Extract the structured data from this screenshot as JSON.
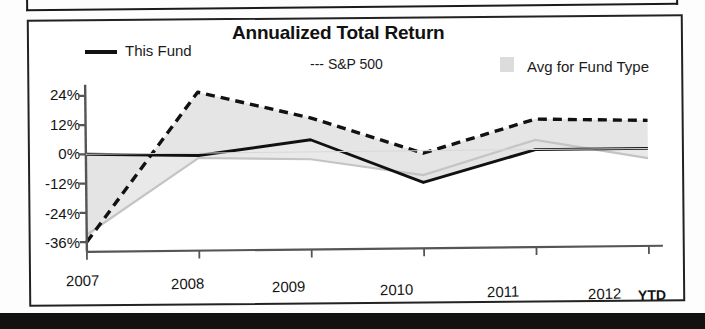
{
  "chart_data": {
    "type": "line",
    "title": "Annualized Total Return",
    "xlabel": "",
    "ylabel": "",
    "categories": [
      "2007",
      "2008",
      "2009",
      "2010",
      "2011",
      "2012"
    ],
    "x_tick_labels": [
      "2007",
      "2008",
      "2009",
      "2010",
      "2011",
      "2012"
    ],
    "x_axis_note": "YTD",
    "y_tick_labels": [
      "24%",
      "12%",
      "0%",
      "-12%",
      "-24%",
      "-36%"
    ],
    "y_tick_values": [
      24,
      12,
      0,
      -12,
      -24,
      -36
    ],
    "ylim": [
      -40,
      28
    ],
    "grid": false,
    "legend_position": "top",
    "series": [
      {
        "name": "This Fund",
        "style": "solid-line",
        "color": "#111111",
        "values": [
          0,
          -1,
          5,
          -13,
          0,
          0
        ]
      },
      {
        "name": "S&P 500",
        "style": "dashed-line",
        "color": "#111111",
        "values": [
          -36,
          25,
          14,
          -1,
          12.5,
          11.5
        ]
      },
      {
        "name": "Avg for Fund Type",
        "style": "shaded-band-gray-line",
        "color": "#c9c9c9",
        "values": [
          -33,
          -2,
          -3,
          -10,
          4,
          -4
        ]
      }
    ],
    "annotations": []
  },
  "legend": {
    "items": [
      {
        "label": "This Fund",
        "marker": "solid-line-marker"
      },
      {
        "label": "--- S&P 500",
        "marker": "dashed-line-marker"
      },
      {
        "label": "Avg for Fund Type",
        "marker": "gray-square-swatch"
      }
    ]
  },
  "axis": {
    "y_labels": [
      "24%",
      "12%",
      "0%",
      "-12%",
      "-24%",
      "-36%"
    ],
    "x_labels": [
      "2007",
      "2008",
      "2009",
      "2010",
      "2011",
      "2012"
    ],
    "ytd_label": "YTD"
  },
  "colors": {
    "line_primary": "#111111",
    "line_dashed": "#111111",
    "band_fill": "#e4e4e4",
    "band_line": "#c4c4c4",
    "axis": "#555555",
    "frame": "#222222"
  }
}
